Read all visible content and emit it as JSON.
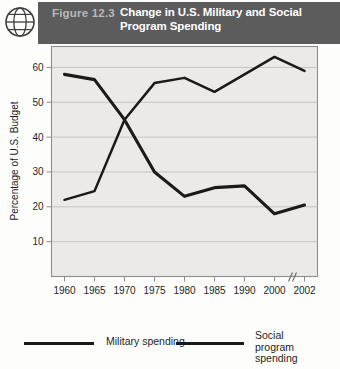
{
  "header": {
    "icon": "globe-icon",
    "figure_number": "Figure 12.3",
    "title": "Change in U.S. Military and Social Program Spending",
    "band_color": "#5c5c5c",
    "figure_number_color": "#b9b9b9",
    "title_color": "#ffffff"
  },
  "chart_data": {
    "type": "line",
    "title": "Change in U.S. Military and Social Program Spending",
    "xlabel": "",
    "ylabel": "Percentage of U.S. Budget",
    "categories": [
      "1960",
      "1965",
      "1970",
      "1975",
      "1980",
      "1985",
      "1990",
      "2000",
      "2002"
    ],
    "yticks": [
      10,
      20,
      30,
      40,
      50,
      60
    ],
    "ylim": [
      0,
      66
    ],
    "grid": true,
    "axis_break": {
      "between": [
        "1990",
        "2000"
      ],
      "marker": "//"
    },
    "legend_position": "bottom",
    "series": [
      {
        "name": "Military spending",
        "color": "#1a1a1a",
        "values": [
          58,
          56.5,
          45,
          30,
          23,
          25.5,
          26,
          18,
          20.5
        ]
      },
      {
        "name": "Social program spending",
        "color": "#1a1a1a",
        "values": [
          22,
          24.5,
          45,
          55.5,
          57,
          53,
          58,
          63,
          59
        ]
      }
    ]
  },
  "legend": {
    "items": [
      {
        "label": "Military spending"
      },
      {
        "label": "Social program\nspending"
      }
    ]
  }
}
